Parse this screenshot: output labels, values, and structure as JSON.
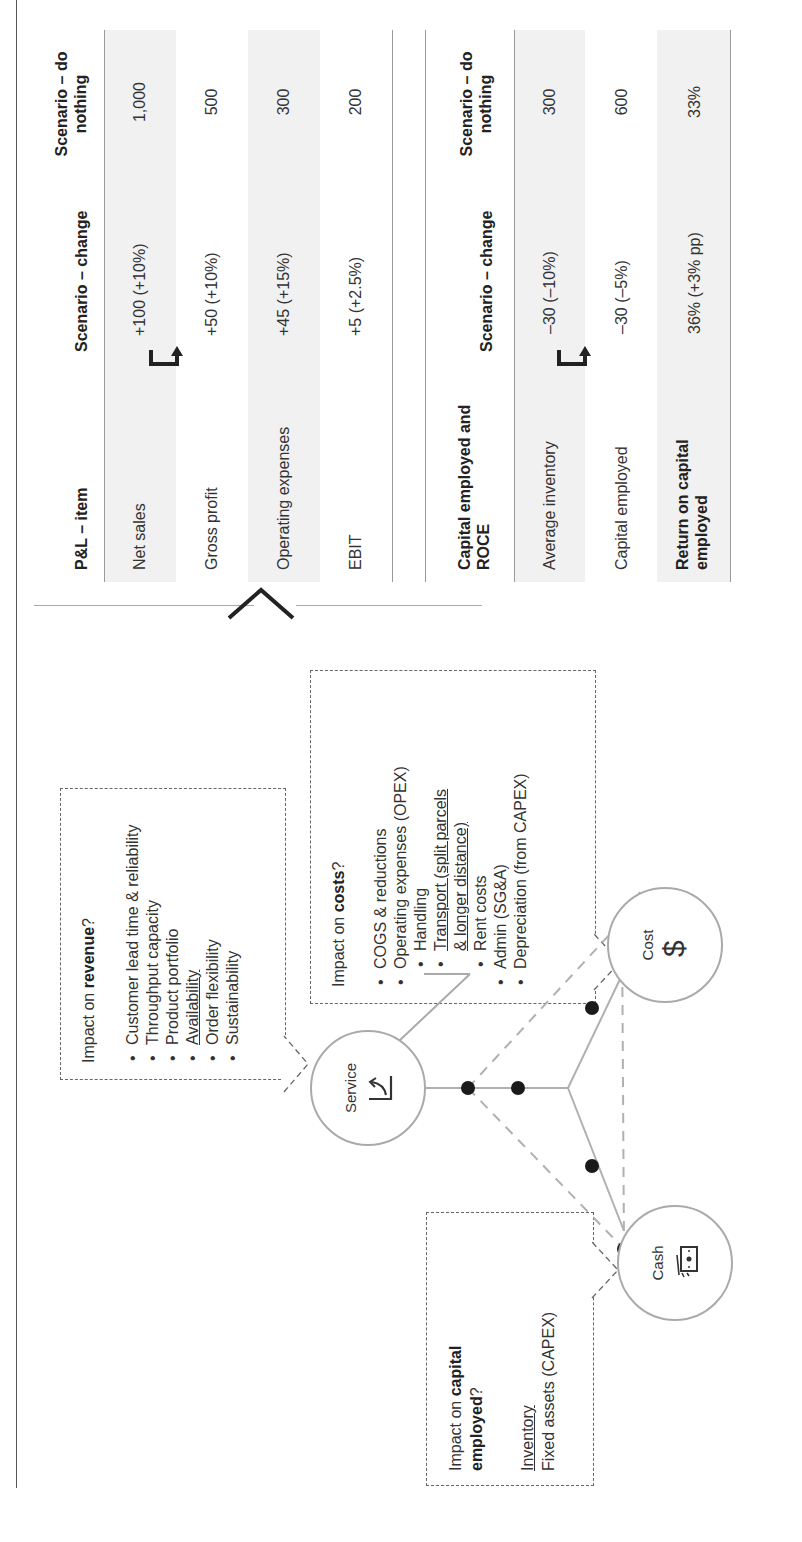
{
  "pnl_table": {
    "headers": [
      "P&L – item",
      "Scenario – change",
      "Scenario – do nothing"
    ],
    "rows": [
      {
        "item": "Net sales",
        "change": "+100 (+10%)",
        "do_nothing": "1,000"
      },
      {
        "item": "Gross profit",
        "change": "+50 (+10%)",
        "do_nothing": "500"
      },
      {
        "item": "Operating expenses",
        "change": "+45 (+15%)",
        "do_nothing": "300"
      },
      {
        "item": "EBIT",
        "change": "+5 (+2.5%)",
        "do_nothing": "200"
      }
    ]
  },
  "capital_table": {
    "headers": [
      "Capital employed and ROCE",
      "Scenario – change",
      "Scenario – do nothing"
    ],
    "rows": [
      {
        "item": "Average inventory",
        "change": "–30 (–10%)",
        "do_nothing": "300"
      },
      {
        "item": "Capital employed",
        "change": "–30 (–5%)",
        "do_nothing": "600"
      },
      {
        "item": "Return on capital employed",
        "change": "36% (+3% pp)",
        "do_nothing": "33%"
      }
    ]
  },
  "revenue_box": {
    "title_prefix": "Impact on ",
    "title_bold": "revenue",
    "title_suffix": "?",
    "items": [
      "Customer lead time & reliability",
      "Throughput capacity",
      "Product portfolio",
      "Availability",
      "Order flexibility",
      "Sustainability"
    ]
  },
  "costs_box": {
    "title_prefix": "Impact on ",
    "title_bold": "costs",
    "title_suffix": "?",
    "items": [
      "COGS & reductions",
      "Operating expenses (OPEX)",
      "Handling",
      "Transport (split parcels",
      "& longer distance)",
      "Rent costs",
      "Admin (SG&A)",
      "Depreciation (from CAPEX)"
    ]
  },
  "capital_box": {
    "title_prefix": "Impact on ",
    "title_bold_1": "capital",
    "title_bold_2": "employed",
    "title_suffix": "?",
    "items": [
      "Inventory",
      "Fixed assets (CAPEX)"
    ]
  },
  "nodes": {
    "service": {
      "label": "Service",
      "icon": "rising-chart-icon"
    },
    "cost": {
      "label": "Cost",
      "icon": "dollar-icon"
    },
    "cash": {
      "label": "Cash",
      "icon": "banknotes-icon"
    }
  },
  "colors": {
    "line": "#aaaaaa",
    "dot": "#1a1a1a",
    "shade": "#f1f1f1",
    "text": "#333333"
  }
}
